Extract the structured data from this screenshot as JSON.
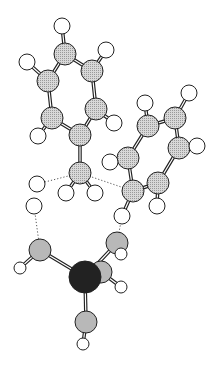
{
  "diagram": {
    "type": "ball-and-stick molecular structure",
    "colors": {
      "carbon": "#c4c4c4",
      "hydrogen": "#ffffff",
      "oxygen": "#b8b8b8",
      "metal": "#222222",
      "outline": "#222222",
      "hbond": "#555555"
    },
    "atoms": [
      {
        "id": "H1",
        "el": "H",
        "x": 62,
        "y": 26,
        "r": 8
      },
      {
        "id": "C1",
        "el": "C",
        "x": 65,
        "y": 54,
        "r": 11
      },
      {
        "id": "H2",
        "el": "H",
        "x": 106,
        "y": 50,
        "r": 8
      },
      {
        "id": "C2",
        "el": "C",
        "x": 92,
        "y": 71,
        "r": 11
      },
      {
        "id": "H3",
        "el": "H",
        "x": 27,
        "y": 62,
        "r": 8
      },
      {
        "id": "C3",
        "el": "C",
        "x": 48,
        "y": 81,
        "r": 11
      },
      {
        "id": "C4",
        "el": "C",
        "x": 96,
        "y": 109,
        "r": 11
      },
      {
        "id": "C5",
        "el": "C",
        "x": 52,
        "y": 118,
        "r": 11
      },
      {
        "id": "H4",
        "el": "H",
        "x": 114,
        "y": 123,
        "r": 8
      },
      {
        "id": "C6",
        "el": "C",
        "x": 80,
        "y": 135,
        "r": 11
      },
      {
        "id": "H5",
        "el": "H",
        "x": 38,
        "y": 136,
        "r": 8
      },
      {
        "id": "C7",
        "el": "C",
        "x": 80,
        "y": 173,
        "r": 11
      },
      {
        "id": "H6",
        "el": "H",
        "x": 145,
        "y": 103,
        "r": 8
      },
      {
        "id": "H7",
        "el": "H",
        "x": 189,
        "y": 93,
        "r": 8
      },
      {
        "id": "C8",
        "el": "C",
        "x": 148,
        "y": 126,
        "r": 11
      },
      {
        "id": "C9",
        "el": "C",
        "x": 175,
        "y": 118,
        "r": 11
      },
      {
        "id": "C10",
        "el": "C",
        "x": 179,
        "y": 148,
        "r": 11
      },
      {
        "id": "H8",
        "el": "H",
        "x": 197,
        "y": 146,
        "r": 8
      },
      {
        "id": "C11",
        "el": "C",
        "x": 128,
        "y": 158,
        "r": 11
      },
      {
        "id": "H9",
        "el": "H",
        "x": 110,
        "y": 162,
        "r": 8
      },
      {
        "id": "C12",
        "el": "C",
        "x": 158,
        "y": 183,
        "r": 11
      },
      {
        "id": "C13",
        "el": "C",
        "x": 133,
        "y": 191,
        "r": 11
      },
      {
        "id": "H10",
        "el": "H",
        "x": 66,
        "y": 193,
        "r": 8
      },
      {
        "id": "H11",
        "el": "H",
        "x": 95,
        "y": 193,
        "r": 8
      },
      {
        "id": "H12",
        "el": "H",
        "x": 157,
        "y": 206,
        "r": 8
      },
      {
        "id": "H13",
        "el": "H",
        "x": 37,
        "y": 184,
        "r": 8
      },
      {
        "id": "H14",
        "el": "H",
        "x": 34,
        "y": 206,
        "r": 8
      },
      {
        "id": "H15",
        "el": "H",
        "x": 122,
        "y": 216,
        "r": 8
      },
      {
        "id": "O1",
        "el": "O",
        "x": 40,
        "y": 250,
        "r": 11
      },
      {
        "id": "O2",
        "el": "O",
        "x": 117,
        "y": 243,
        "r": 11
      },
      {
        "id": "H16",
        "el": "H",
        "x": 20,
        "y": 268,
        "r": 6
      },
      {
        "id": "H17",
        "el": "H",
        "x": 121,
        "y": 254,
        "r": 6
      },
      {
        "id": "O3",
        "el": "O",
        "x": 101,
        "y": 272,
        "r": 11
      },
      {
        "id": "M1",
        "el": "M",
        "x": 85,
        "y": 277,
        "r": 16
      },
      {
        "id": "H18",
        "el": "H",
        "x": 121,
        "y": 287,
        "r": 6
      },
      {
        "id": "O4",
        "el": "O",
        "x": 86,
        "y": 322,
        "r": 11
      },
      {
        "id": "H19",
        "el": "H",
        "x": 83,
        "y": 344,
        "r": 6
      }
    ],
    "bonds": [
      [
        "H1",
        "C1"
      ],
      [
        "C1",
        "C2"
      ],
      [
        "C1",
        "C3"
      ],
      [
        "H2",
        "C2"
      ],
      [
        "C2",
        "C4"
      ],
      [
        "H3",
        "C3"
      ],
      [
        "C3",
        "C5"
      ],
      [
        "C4",
        "C6"
      ],
      [
        "C4",
        "H4"
      ],
      [
        "C5",
        "C6"
      ],
      [
        "C5",
        "H5"
      ],
      [
        "C6",
        "C7"
      ],
      [
        "C7",
        "H10"
      ],
      [
        "C7",
        "H11"
      ],
      [
        "H6",
        "C8"
      ],
      [
        "H7",
        "C9"
      ],
      [
        "C8",
        "C9"
      ],
      [
        "C8",
        "C11"
      ],
      [
        "C9",
        "C10"
      ],
      [
        "C10",
        "H8"
      ],
      [
        "C10",
        "C12"
      ],
      [
        "C11",
        "H9"
      ],
      [
        "C11",
        "C13"
      ],
      [
        "C12",
        "C13"
      ],
      [
        "C12",
        "H12"
      ],
      [
        "C13",
        "H15"
      ],
      [
        "O1",
        "H16"
      ],
      [
        "O1",
        "M1"
      ],
      [
        "O2",
        "M1"
      ],
      [
        "O2",
        "H17"
      ],
      [
        "O3",
        "M1"
      ],
      [
        "O3",
        "H18"
      ],
      [
        "M1",
        "O4"
      ],
      [
        "O4",
        "H19"
      ]
    ],
    "hbonds": [
      [
        "C7",
        "H13"
      ],
      [
        "C7",
        "C13"
      ],
      [
        "H14",
        "O1"
      ],
      [
        "H15",
        "O2"
      ]
    ]
  }
}
